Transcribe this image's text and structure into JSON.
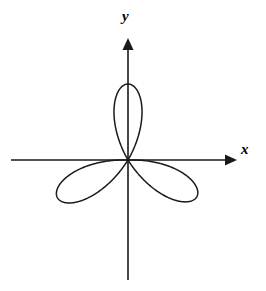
{
  "figure": {
    "kind": "polar-rose-curve",
    "background_color": "#ffffff",
    "stroke_color": "#1a1a1a",
    "width": 266,
    "height": 291
  },
  "axes": {
    "origin": {
      "x": 128,
      "y": 160
    },
    "x_axis": {
      "label": "x",
      "start_x": 11,
      "end_x": 237,
      "y": 160,
      "arrow": "right-arrowhead-icon",
      "label_position": {
        "x": 241,
        "y": 142
      }
    },
    "y_axis": {
      "label": "y",
      "start_y": 280,
      "end_y": 38,
      "x": 128,
      "arrow": "up-arrowhead-icon",
      "label_position": {
        "x": 122,
        "y": 9
      }
    },
    "tick_labels": [],
    "gridlines": false
  },
  "chart_data": {
    "type": "line",
    "title": "",
    "xlabel": "x",
    "ylabel": "y",
    "subtitle": "",
    "curve_equation": "r = a*sin(3θ)",
    "coordinate_system": "polar",
    "petal_count": 3,
    "amplitude_px": 78,
    "petals": [
      {
        "name": "upper-petal",
        "axis_angle_deg": 90,
        "tip_radius_px": 76,
        "tip_point": {
          "x": 128,
          "y": 84
        }
      },
      {
        "name": "lower-left-petal",
        "axis_angle_deg": 208,
        "tip_radius_px": 80,
        "tip_point": {
          "x": 57,
          "y": 196
        }
      },
      {
        "name": "lower-right-petal",
        "axis_angle_deg": 332,
        "tip_radius_px": 78,
        "tip_point": {
          "x": 198,
          "y": 193
        }
      }
    ],
    "theta_range_deg": [
      0,
      360
    ],
    "xlim": [
      -128,
      138
    ],
    "ylim": [
      -120,
      122
    ],
    "grid": false,
    "legend": null,
    "annotations": []
  }
}
